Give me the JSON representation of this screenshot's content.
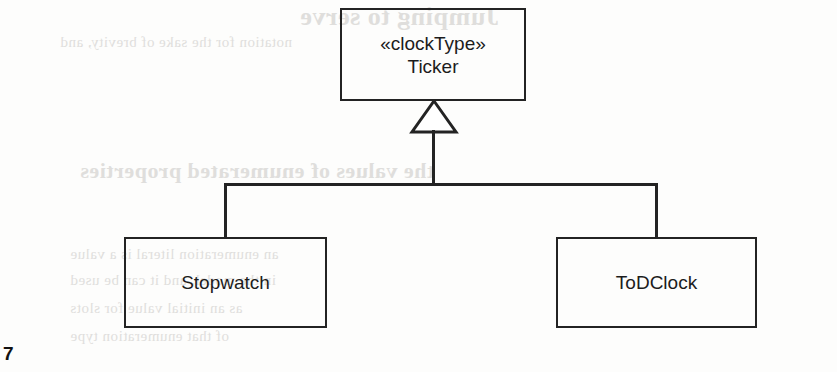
{
  "page": {
    "page_number": "7",
    "background_color": "#fdfdfc",
    "ink_color": "#232323"
  },
  "diagram": {
    "type": "uml-class-diagram",
    "relationship": "generalization",
    "classes": [
      {
        "id": "ticker",
        "stereotype": "«clockType»",
        "name": "Ticker",
        "role": "superclass"
      },
      {
        "id": "stopwatch",
        "stereotype": "",
        "name": "Stopwatch",
        "role": "subclass"
      },
      {
        "id": "todclock",
        "stereotype": "",
        "name": "ToDClock",
        "role": "subclass"
      }
    ],
    "connector": {
      "arrow_kind": "hollow-triangle",
      "points_to": "Ticker",
      "from": [
        "Stopwatch",
        "ToDClock"
      ]
    }
  },
  "bleed_through": {
    "note": "faint mirrored show-through text from the reverse side of the scanned page",
    "lines": [
      {
        "text": "Jumping to serve",
        "x": 300,
        "y": 2,
        "kind": "bleed-title"
      },
      {
        "text": "notation for the sake of brevity, and",
        "x": 60,
        "y": 34,
        "kind": "bleed-body"
      },
      {
        "text": "the values of enumerated properties",
        "x": 80,
        "y": 158,
        "kind": "bleed-head"
      },
      {
        "text": "an enumeration literal is a value",
        "x": 70,
        "y": 246,
        "kind": "bleed-body"
      },
      {
        "text": "in the model, and it can be used",
        "x": 70,
        "y": 272,
        "kind": "bleed-body"
      },
      {
        "text": "as an initial value for slots",
        "x": 70,
        "y": 300,
        "kind": "bleed-body"
      },
      {
        "text": "of that enumeration type",
        "x": 70,
        "y": 328,
        "kind": "bleed-body"
      }
    ]
  }
}
